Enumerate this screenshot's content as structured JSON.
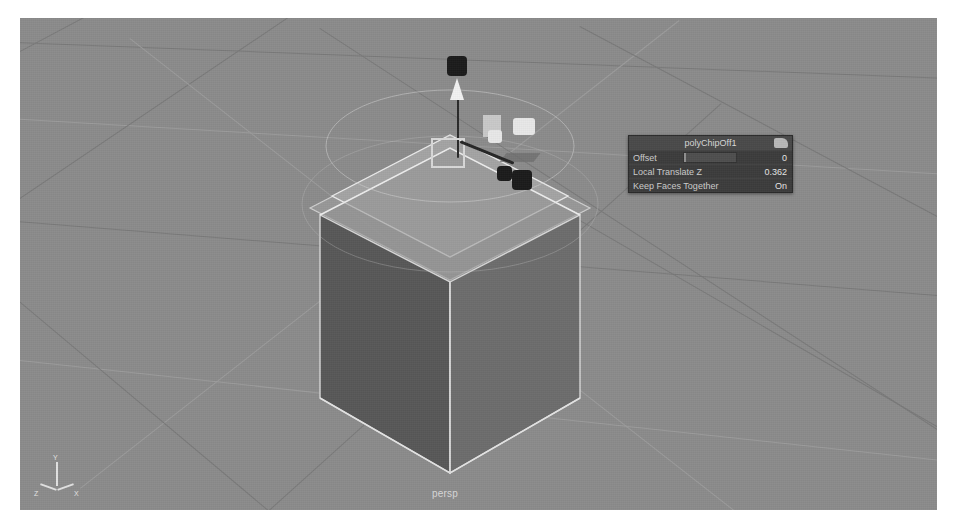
{
  "app": {
    "name": "Autodesk Maya",
    "viewport_type": "perspective"
  },
  "viewport": {
    "camera_label": "persp",
    "background_color": "#8b8b8b",
    "grid_line_color": "#7a7a7a",
    "object_name": "pCube1",
    "cube_face_left_color": "#585858",
    "cube_face_right_color": "#6d6d6d",
    "cube_face_top_color": "#9a9a9a",
    "selection_highlight_color": "#e8e8e8"
  },
  "axis_gizmo": {
    "y_label": "Y",
    "z_label": "Z",
    "x_label": "X"
  },
  "tool_panel": {
    "title": "polyChipOff1",
    "menu_icon": "panel-menu-icon",
    "rows": [
      {
        "label": "Offset",
        "value": "0"
      },
      {
        "label": "Local Translate Z",
        "value": "0.362"
      },
      {
        "label": "Keep Faces Together",
        "value": "On"
      }
    ]
  },
  "manipulator": {
    "type": "move-manipulator",
    "handles": [
      "y-axis-arrow-handle",
      "x-axis-handle",
      "z-axis-handle",
      "center-plane-handle",
      "plane-chip-handle"
    ]
  }
}
